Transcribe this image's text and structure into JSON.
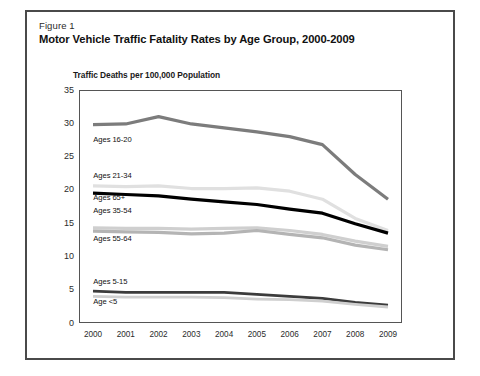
{
  "figure": {
    "number": "Figure 1",
    "title": "Motor Vehicle Traffic Fatality Rates by Age Group, 2000-2009"
  },
  "chart_data": {
    "type": "line",
    "title": "Motor Vehicle Traffic Fatality Rates by Age Group, 2000-2009",
    "subtitle": "Figure 1",
    "ylabel": "Traffic Deaths per 100,000 Population",
    "xlabel": "",
    "ylim": [
      0,
      35
    ],
    "yticks": [
      "0",
      "5",
      "10",
      "15",
      "20",
      "25",
      "30",
      "35"
    ],
    "ytick_values": [
      0,
      5,
      10,
      15,
      20,
      25,
      30,
      35
    ],
    "grid": false,
    "legend": "inline-labels",
    "categories": [
      "2000",
      "2001",
      "2002",
      "2003",
      "2004",
      "2005",
      "2006",
      "2007",
      "2008",
      "2009"
    ],
    "x": [
      2000,
      2001,
      2002,
      2003,
      2004,
      2005,
      2006,
      2007,
      2008,
      2009
    ],
    "series": [
      {
        "name": "Ages 16-20",
        "color": "#7c7c7c",
        "width": 3.2,
        "values": [
          29.8,
          29.9,
          31.0,
          29.9,
          29.3,
          28.7,
          28.0,
          26.8,
          22.3,
          18.6
        ],
        "label_x": 2000.1,
        "label_y": 27.6
      },
      {
        "name": "Ages 21-34",
        "color": "#e0e0e0",
        "width": 3.2,
        "values": [
          20.6,
          20.5,
          20.6,
          20.2,
          20.2,
          20.3,
          19.8,
          18.6,
          15.7,
          13.9
        ],
        "label_x": 2000.1,
        "label_y": 22.3
      },
      {
        "name": "Ages 65+",
        "color": "#000000",
        "width": 3.2,
        "values": [
          19.5,
          19.3,
          19.1,
          18.6,
          18.2,
          17.8,
          17.1,
          16.5,
          14.9,
          13.5
        ],
        "label_x": 2000.1,
        "label_y": 19.0
      },
      {
        "name": "Ages 35-54",
        "color": "#cfcfcf",
        "width": 3.2,
        "values": [
          14.3,
          14.2,
          14.2,
          14.1,
          14.2,
          14.3,
          13.9,
          13.3,
          12.3,
          11.5
        ],
        "label_x": 2000.1,
        "label_y": 16.9
      },
      {
        "name": "Ages 55-64",
        "color": "#b4b4b4",
        "width": 3.2,
        "values": [
          13.8,
          13.7,
          13.6,
          13.4,
          13.5,
          13.9,
          13.3,
          12.8,
          11.7,
          11.0
        ],
        "label_x": 2000.1,
        "label_y": 12.8
      },
      {
        "name": "Ages 5-15",
        "color": "#3c3c3c",
        "width": 2.8,
        "values": [
          4.8,
          4.6,
          4.6,
          4.6,
          4.6,
          4.3,
          4.0,
          3.7,
          3.1,
          2.7
        ],
        "label_x": 2000.1,
        "label_y": 6.3
      },
      {
        "name": "Age <5",
        "color": "#cfcfcf",
        "width": 2.8,
        "values": [
          4.0,
          3.9,
          3.9,
          3.9,
          3.8,
          3.6,
          3.5,
          3.3,
          2.8,
          2.4
        ],
        "label_x": 2000.1,
        "label_y": 3.3
      }
    ]
  }
}
